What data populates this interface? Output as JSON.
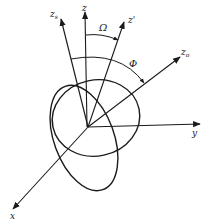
{
  "diagram": {
    "type": "3d-coordinate-rotation-diagram",
    "axes": [
      {
        "id": "z_s",
        "label": "z",
        "subscript": "s"
      },
      {
        "id": "z",
        "label": "z",
        "subscript": ""
      },
      {
        "id": "z_prime",
        "label": "z'",
        "subscript": ""
      },
      {
        "id": "z_o",
        "label": "z",
        "subscript": "o"
      },
      {
        "id": "y",
        "label": "y",
        "subscript": ""
      },
      {
        "id": "x",
        "label": "x",
        "subscript": ""
      }
    ],
    "angles": [
      {
        "id": "omega",
        "label": "Ω",
        "between": [
          "z",
          "z'"
        ]
      },
      {
        "id": "phi",
        "label": "Φ",
        "between": [
          "z_s",
          "z_o"
        ]
      }
    ],
    "shapes": [
      {
        "id": "ellipse-1",
        "kind": "ellipse"
      },
      {
        "id": "ellipse-2",
        "kind": "ellipse"
      }
    ],
    "colors": {
      "ink": "#1a1a1a",
      "background": "#ffffff"
    }
  }
}
